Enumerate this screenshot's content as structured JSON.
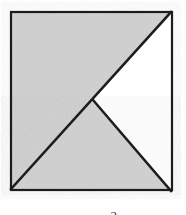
{
  "figure": {
    "name": "shaded-square-diagonals",
    "background_color": "#fefefe",
    "paper_tint": "#fdfdfd",
    "shade_color": "#d2d2d2",
    "line_color": "#1c1c1c",
    "unshaded_color": "#ffffff",
    "square": {
      "label": "square",
      "left": 10,
      "top": 11,
      "right": 172,
      "bottom": 190,
      "border_width": 2
    },
    "vertices": {
      "top_left": [
        10,
        11
      ],
      "top_right": [
        172,
        11
      ],
      "bottom_right": [
        172,
        190
      ],
      "bottom_left": [
        10,
        190
      ],
      "center": [
        92,
        101
      ]
    },
    "lines": [
      {
        "name": "main-diagonal",
        "from": [
          10,
          190
        ],
        "to": [
          172,
          11
        ],
        "width": 2.6
      },
      {
        "name": "center-to-bottom-right-diagonal",
        "from": [
          92,
          101
        ],
        "to": [
          172,
          190
        ],
        "width": 2.6
      }
    ],
    "regions": [
      {
        "name": "upper-left-shaded-triangle",
        "fill": "shaded",
        "points": "10,11 172,11 10,190"
      },
      {
        "name": "lower-middle-shaded-triangle",
        "fill": "shaded",
        "points": "10,190 92,101 172,190"
      },
      {
        "name": "right-unshaded-triangle",
        "fill": "unshaded",
        "points": "92,101 172,11 172,190"
      }
    ]
  },
  "caption": {
    "text": "2",
    "note": "partial digit clipped at bottom edge of image"
  }
}
